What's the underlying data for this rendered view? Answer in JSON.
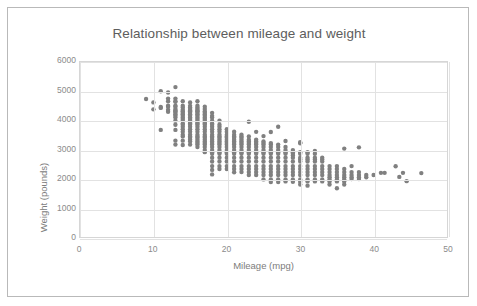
{
  "chart_data": {
    "type": "scatter",
    "title": "Relationship between mileage and weight",
    "xlabel": "Mileage (mpg)",
    "ylabel": "Weight (pounds)",
    "xlim": [
      0,
      50
    ],
    "ylim": [
      0,
      6000
    ],
    "xticks": [
      "0",
      "10",
      "20",
      "30",
      "40",
      "50"
    ],
    "yticks": [
      "0",
      "1000",
      "2000",
      "3000",
      "4000",
      "5000",
      "6000"
    ],
    "grid": true,
    "legend": "none",
    "marker_color": "#808080",
    "marker_size": 4.4,
    "series_name": "vehicles",
    "points": [
      [
        9.0,
        4732
      ],
      [
        10.0,
        4615
      ],
      [
        10.0,
        4376
      ],
      [
        11.0,
        4997
      ],
      [
        11.0,
        4425
      ],
      [
        11.0,
        4456
      ],
      [
        11.0,
        3672
      ],
      [
        12.0,
        4955
      ],
      [
        12.0,
        4746
      ],
      [
        12.0,
        4654
      ],
      [
        12.0,
        4502
      ],
      [
        12.0,
        4464
      ],
      [
        12.0,
        4360
      ],
      [
        12.0,
        4294
      ],
      [
        13.0,
        5140
      ],
      [
        13.0,
        4746
      ],
      [
        13.0,
        4654
      ],
      [
        13.0,
        4633
      ],
      [
        13.0,
        4502
      ],
      [
        13.0,
        4464
      ],
      [
        13.0,
        4385
      ],
      [
        13.0,
        4341
      ],
      [
        13.0,
        4312
      ],
      [
        13.0,
        4257
      ],
      [
        13.0,
        4209
      ],
      [
        13.0,
        4154
      ],
      [
        13.0,
        4098
      ],
      [
        13.0,
        3988
      ],
      [
        13.0,
        3850
      ],
      [
        13.0,
        3672
      ],
      [
        13.0,
        3302
      ],
      [
        13.0,
        3169
      ],
      [
        14.0,
        4657
      ],
      [
        14.0,
        4502
      ],
      [
        14.0,
        4441
      ],
      [
        14.0,
        4363
      ],
      [
        14.0,
        4312
      ],
      [
        14.0,
        4257
      ],
      [
        14.0,
        4209
      ],
      [
        14.0,
        4154
      ],
      [
        14.0,
        4098
      ],
      [
        14.0,
        4042
      ],
      [
        14.0,
        3988
      ],
      [
        14.0,
        3892
      ],
      [
        14.0,
        3850
      ],
      [
        14.0,
        3777
      ],
      [
        14.0,
        3693
      ],
      [
        14.0,
        3609
      ],
      [
        14.0,
        3504
      ],
      [
        14.0,
        3449
      ],
      [
        14.0,
        3302
      ],
      [
        14.0,
        3155
      ],
      [
        15.0,
        4615
      ],
      [
        15.0,
        4498
      ],
      [
        15.0,
        4440
      ],
      [
        15.0,
        4385
      ],
      [
        15.0,
        4341
      ],
      [
        15.0,
        4312
      ],
      [
        15.0,
        4257
      ],
      [
        15.0,
        4209
      ],
      [
        15.0,
        4154
      ],
      [
        15.0,
        4098
      ],
      [
        15.0,
        4042
      ],
      [
        15.0,
        3988
      ],
      [
        15.0,
        3940
      ],
      [
        15.0,
        3892
      ],
      [
        15.0,
        3850
      ],
      [
        15.0,
        3777
      ],
      [
        15.0,
        3693
      ],
      [
        15.0,
        3609
      ],
      [
        15.0,
        3504
      ],
      [
        15.0,
        3449
      ],
      [
        15.0,
        3399
      ],
      [
        15.0,
        3336
      ],
      [
        15.0,
        3278
      ],
      [
        15.0,
        3169
      ],
      [
        16.0,
        4654
      ],
      [
        16.0,
        4502
      ],
      [
        16.0,
        4440
      ],
      [
        16.0,
        4385
      ],
      [
        16.0,
        4341
      ],
      [
        16.0,
        4312
      ],
      [
        16.0,
        4257
      ],
      [
        16.0,
        4209
      ],
      [
        16.0,
        4154
      ],
      [
        16.0,
        4098
      ],
      [
        16.0,
        4042
      ],
      [
        16.0,
        3988
      ],
      [
        16.0,
        3940
      ],
      [
        16.0,
        3892
      ],
      [
        16.0,
        3850
      ],
      [
        16.0,
        3777
      ],
      [
        16.0,
        3693
      ],
      [
        16.0,
        3609
      ],
      [
        16.0,
        3504
      ],
      [
        16.0,
        3449
      ],
      [
        16.0,
        3399
      ],
      [
        16.0,
        3336
      ],
      [
        16.0,
        3278
      ],
      [
        16.0,
        3221
      ],
      [
        16.0,
        3169
      ],
      [
        16.0,
        3085
      ],
      [
        17.0,
        4464
      ],
      [
        17.0,
        4385
      ],
      [
        17.0,
        4312
      ],
      [
        17.0,
        4257
      ],
      [
        17.0,
        4209
      ],
      [
        17.0,
        4154
      ],
      [
        17.0,
        4098
      ],
      [
        17.0,
        4042
      ],
      [
        17.0,
        3988
      ],
      [
        17.0,
        3940
      ],
      [
        17.0,
        3892
      ],
      [
        17.0,
        3850
      ],
      [
        17.0,
        3777
      ],
      [
        17.0,
        3693
      ],
      [
        17.0,
        3609
      ],
      [
        17.0,
        3504
      ],
      [
        17.0,
        3449
      ],
      [
        17.0,
        3399
      ],
      [
        17.0,
        3336
      ],
      [
        17.0,
        3278
      ],
      [
        17.0,
        3221
      ],
      [
        17.0,
        3169
      ],
      [
        17.0,
        3085
      ],
      [
        17.0,
        2979
      ],
      [
        17.0,
        2910
      ],
      [
        18.0,
        4257
      ],
      [
        18.0,
        4154
      ],
      [
        18.0,
        4098
      ],
      [
        18.0,
        3988
      ],
      [
        18.0,
        3892
      ],
      [
        18.0,
        3850
      ],
      [
        18.0,
        3777
      ],
      [
        18.0,
        3693
      ],
      [
        18.0,
        3609
      ],
      [
        18.0,
        3504
      ],
      [
        18.0,
        3449
      ],
      [
        18.0,
        3399
      ],
      [
        18.0,
        3336
      ],
      [
        18.0,
        3278
      ],
      [
        18.0,
        3221
      ],
      [
        18.0,
        3169
      ],
      [
        18.0,
        3085
      ],
      [
        18.0,
        2979
      ],
      [
        18.0,
        2910
      ],
      [
        18.0,
        2855
      ],
      [
        18.0,
        2720
      ],
      [
        18.0,
        2587
      ],
      [
        18.0,
        2430
      ],
      [
        18.0,
        2300
      ],
      [
        18.0,
        2145
      ],
      [
        19.0,
        3988
      ],
      [
        19.0,
        3850
      ],
      [
        19.0,
        3777
      ],
      [
        19.0,
        3693
      ],
      [
        19.0,
        3609
      ],
      [
        19.0,
        3504
      ],
      [
        19.0,
        3449
      ],
      [
        19.0,
        3399
      ],
      [
        19.0,
        3336
      ],
      [
        19.0,
        3278
      ],
      [
        19.0,
        3221
      ],
      [
        19.0,
        3169
      ],
      [
        19.0,
        3085
      ],
      [
        19.0,
        2979
      ],
      [
        19.0,
        2910
      ],
      [
        19.0,
        2855
      ],
      [
        19.0,
        2720
      ],
      [
        19.0,
        2587
      ],
      [
        19.0,
        2430
      ],
      [
        19.0,
        2330
      ],
      [
        20.0,
        3693
      ],
      [
        20.0,
        3609
      ],
      [
        20.0,
        3504
      ],
      [
        20.0,
        3449
      ],
      [
        20.0,
        3399
      ],
      [
        20.0,
        3336
      ],
      [
        20.0,
        3278
      ],
      [
        20.0,
        3221
      ],
      [
        20.0,
        3169
      ],
      [
        20.0,
        3085
      ],
      [
        20.0,
        2979
      ],
      [
        20.0,
        2910
      ],
      [
        20.0,
        2855
      ],
      [
        20.0,
        2720
      ],
      [
        20.0,
        2587
      ],
      [
        20.0,
        2430
      ],
      [
        20.0,
        2330
      ],
      [
        21.0,
        3609
      ],
      [
        21.0,
        3504
      ],
      [
        21.0,
        3449
      ],
      [
        21.0,
        3399
      ],
      [
        21.0,
        3336
      ],
      [
        21.0,
        3278
      ],
      [
        21.0,
        3221
      ],
      [
        21.0,
        3169
      ],
      [
        21.0,
        3085
      ],
      [
        21.0,
        2979
      ],
      [
        21.0,
        2910
      ],
      [
        21.0,
        2855
      ],
      [
        21.0,
        2720
      ],
      [
        21.0,
        2587
      ],
      [
        21.0,
        2430
      ],
      [
        21.0,
        2330
      ],
      [
        21.0,
        2220
      ],
      [
        22.0,
        3504
      ],
      [
        22.0,
        3449
      ],
      [
        22.0,
        3399
      ],
      [
        22.0,
        3336
      ],
      [
        22.0,
        3278
      ],
      [
        22.0,
        3221
      ],
      [
        22.0,
        3169
      ],
      [
        22.0,
        3085
      ],
      [
        22.0,
        2979
      ],
      [
        22.0,
        2910
      ],
      [
        22.0,
        2855
      ],
      [
        22.0,
        2720
      ],
      [
        22.0,
        2587
      ],
      [
        22.0,
        2430
      ],
      [
        22.0,
        2330
      ],
      [
        22.0,
        2226
      ],
      [
        23.0,
        3950
      ],
      [
        23.0,
        3449
      ],
      [
        23.0,
        3336
      ],
      [
        23.0,
        3278
      ],
      [
        23.0,
        3221
      ],
      [
        23.0,
        3169
      ],
      [
        23.0,
        3085
      ],
      [
        23.0,
        2979
      ],
      [
        23.0,
        2910
      ],
      [
        23.0,
        2855
      ],
      [
        23.0,
        2720
      ],
      [
        23.0,
        2587
      ],
      [
        23.0,
        2430
      ],
      [
        23.0,
        2330
      ],
      [
        23.0,
        2226
      ],
      [
        23.0,
        2125
      ],
      [
        24.0,
        3605
      ],
      [
        24.0,
        3336
      ],
      [
        24.0,
        3278
      ],
      [
        24.0,
        3221
      ],
      [
        24.0,
        3169
      ],
      [
        24.0,
        3085
      ],
      [
        24.0,
        2979
      ],
      [
        24.0,
        2910
      ],
      [
        24.0,
        2855
      ],
      [
        24.0,
        2720
      ],
      [
        24.0,
        2587
      ],
      [
        24.0,
        2430
      ],
      [
        24.0,
        2330
      ],
      [
        24.0,
        2226
      ],
      [
        24.0,
        2125
      ],
      [
        25.0,
        3459
      ],
      [
        25.0,
        3278
      ],
      [
        25.0,
        3221
      ],
      [
        25.0,
        3169
      ],
      [
        25.0,
        3085
      ],
      [
        25.0,
        2979
      ],
      [
        25.0,
        2910
      ],
      [
        25.0,
        2855
      ],
      [
        25.0,
        2720
      ],
      [
        25.0,
        2587
      ],
      [
        25.0,
        2430
      ],
      [
        25.0,
        2330
      ],
      [
        25.0,
        2226
      ],
      [
        25.0,
        2125
      ],
      [
        25.0,
        1975
      ],
      [
        26.0,
        3600
      ],
      [
        26.0,
        3221
      ],
      [
        26.0,
        3169
      ],
      [
        26.0,
        3085
      ],
      [
        26.0,
        2979
      ],
      [
        26.0,
        2910
      ],
      [
        26.0,
        2855
      ],
      [
        26.0,
        2720
      ],
      [
        26.0,
        2587
      ],
      [
        26.0,
        2430
      ],
      [
        26.0,
        2330
      ],
      [
        26.0,
        2226
      ],
      [
        26.0,
        2125
      ],
      [
        26.0,
        1975
      ],
      [
        26.0,
        1885
      ],
      [
        27.0,
        3780
      ],
      [
        27.0,
        3169
      ],
      [
        27.0,
        3085
      ],
      [
        27.0,
        2979
      ],
      [
        27.0,
        2910
      ],
      [
        27.0,
        2855
      ],
      [
        27.0,
        2720
      ],
      [
        27.0,
        2587
      ],
      [
        27.0,
        2430
      ],
      [
        27.0,
        2330
      ],
      [
        27.0,
        2226
      ],
      [
        27.0,
        2125
      ],
      [
        27.0,
        1975
      ],
      [
        27.0,
        1885
      ],
      [
        28.0,
        3290
      ],
      [
        28.0,
        3085
      ],
      [
        28.0,
        2979
      ],
      [
        28.0,
        2910
      ],
      [
        28.0,
        2855
      ],
      [
        28.0,
        2720
      ],
      [
        28.0,
        2587
      ],
      [
        28.0,
        2430
      ],
      [
        28.0,
        2330
      ],
      [
        28.0,
        2226
      ],
      [
        28.0,
        2125
      ],
      [
        28.0,
        1975
      ],
      [
        28.0,
        1905
      ],
      [
        29.0,
        2979
      ],
      [
        29.0,
        2910
      ],
      [
        29.0,
        2855
      ],
      [
        29.0,
        2790
      ],
      [
        29.0,
        2720
      ],
      [
        29.0,
        2587
      ],
      [
        29.0,
        2430
      ],
      [
        29.0,
        2330
      ],
      [
        29.0,
        2226
      ],
      [
        29.0,
        2125
      ],
      [
        29.0,
        1975
      ],
      [
        29.0,
        1895
      ],
      [
        30.0,
        3250
      ],
      [
        30.0,
        3210
      ],
      [
        30.0,
        2910
      ],
      [
        30.0,
        2855
      ],
      [
        30.0,
        2720
      ],
      [
        30.0,
        2660
      ],
      [
        30.0,
        2587
      ],
      [
        30.0,
        2430
      ],
      [
        30.0,
        2330
      ],
      [
        30.0,
        2226
      ],
      [
        30.0,
        2125
      ],
      [
        30.0,
        1975
      ],
      [
        30.0,
        1895
      ],
      [
        30.0,
        1800
      ],
      [
        31.0,
        2910
      ],
      [
        31.0,
        2855
      ],
      [
        31.0,
        2720
      ],
      [
        31.0,
        2660
      ],
      [
        31.0,
        2587
      ],
      [
        31.0,
        2430
      ],
      [
        31.0,
        2330
      ],
      [
        31.0,
        2226
      ],
      [
        31.0,
        2125
      ],
      [
        31.0,
        1975
      ],
      [
        31.0,
        1905
      ],
      [
        31.0,
        1760
      ],
      [
        32.0,
        2950
      ],
      [
        32.0,
        2855
      ],
      [
        32.0,
        2720
      ],
      [
        32.0,
        2660
      ],
      [
        32.0,
        2587
      ],
      [
        32.0,
        2430
      ],
      [
        32.0,
        2330
      ],
      [
        32.0,
        2226
      ],
      [
        32.0,
        2125
      ],
      [
        32.0,
        1975
      ],
      [
        32.0,
        1905
      ],
      [
        33.0,
        2720
      ],
      [
        33.0,
        2660
      ],
      [
        33.0,
        2587
      ],
      [
        33.0,
        2430
      ],
      [
        33.0,
        2330
      ],
      [
        33.0,
        2226
      ],
      [
        33.0,
        2125
      ],
      [
        33.0,
        1975
      ],
      [
        33.0,
        1905
      ],
      [
        34.0,
        2430
      ],
      [
        34.0,
        2330
      ],
      [
        34.0,
        2226
      ],
      [
        34.0,
        2125
      ],
      [
        34.0,
        2050
      ],
      [
        34.0,
        1975
      ],
      [
        34.0,
        1905
      ],
      [
        34.0,
        1800
      ],
      [
        35.0,
        2430
      ],
      [
        35.0,
        2330
      ],
      [
        35.0,
        2226
      ],
      [
        35.0,
        2125
      ],
      [
        35.0,
        2050
      ],
      [
        35.0,
        1975
      ],
      [
        35.0,
        1905
      ],
      [
        35.0,
        1670
      ],
      [
        36.0,
        3030
      ],
      [
        36.0,
        2330
      ],
      [
        36.0,
        2226
      ],
      [
        36.0,
        2125
      ],
      [
        36.0,
        2050
      ],
      [
        36.0,
        1975
      ],
      [
        36.0,
        1905
      ],
      [
        36.0,
        1800
      ],
      [
        37.0,
        2430
      ],
      [
        37.0,
        2226
      ],
      [
        37.0,
        2125
      ],
      [
        37.0,
        2050
      ],
      [
        37.0,
        1985
      ],
      [
        38.0,
        3075
      ],
      [
        38.0,
        2226
      ],
      [
        38.0,
        2125
      ],
      [
        38.0,
        2050
      ],
      [
        38.0,
        1985
      ],
      [
        39.0,
        2125
      ],
      [
        39.0,
        2050
      ],
      [
        40.0,
        2125
      ],
      [
        41.0,
        2200
      ],
      [
        41.5,
        2200
      ],
      [
        43.0,
        2425
      ],
      [
        43.5,
        2060
      ],
      [
        44.0,
        2200
      ],
      [
        44.5,
        1915
      ],
      [
        46.5,
        2190
      ]
    ]
  }
}
